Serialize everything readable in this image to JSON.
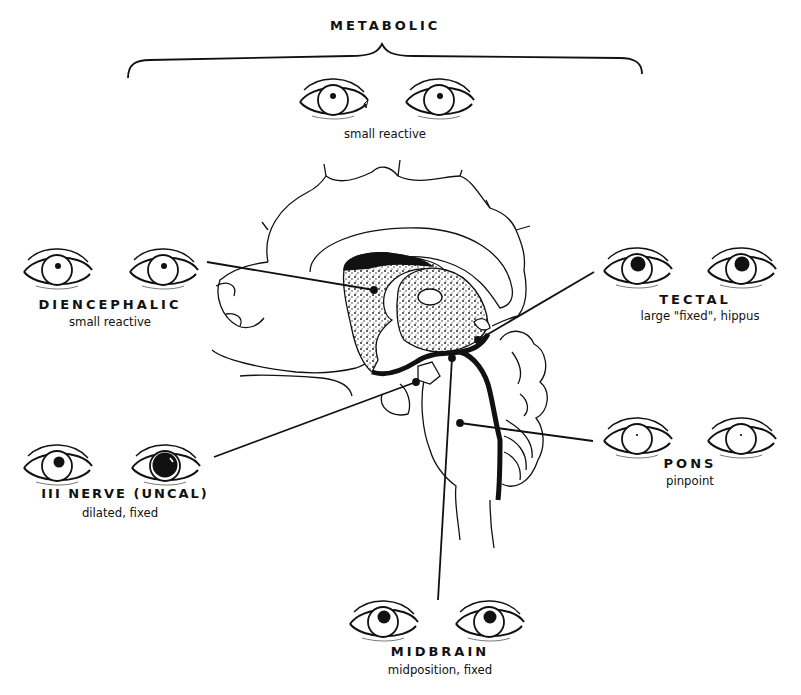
{
  "metabolic": {
    "title": "METABOLIC",
    "description": "small reactive",
    "pupils": [
      "small",
      "small"
    ]
  },
  "diencephalic": {
    "title": "DIENCEPHALIC",
    "description": "small reactive",
    "pupils": [
      "small",
      "small"
    ]
  },
  "tectal": {
    "title": "TECTAL",
    "description": "large \"fixed\", hippus",
    "pupils": [
      "large",
      "large"
    ]
  },
  "third_nerve": {
    "title": "III NERVE (UNCAL)",
    "description": "dilated, fixed",
    "pupils": [
      "medium",
      "dilated"
    ]
  },
  "pons": {
    "title": "PONS",
    "description": "pinpoint",
    "pupils": [
      "pinpoint",
      "pinpoint"
    ]
  },
  "midbrain": {
    "title": "MIDBRAIN",
    "description": "midposition, fixed",
    "pupils": [
      "midposition",
      "midposition"
    ]
  }
}
